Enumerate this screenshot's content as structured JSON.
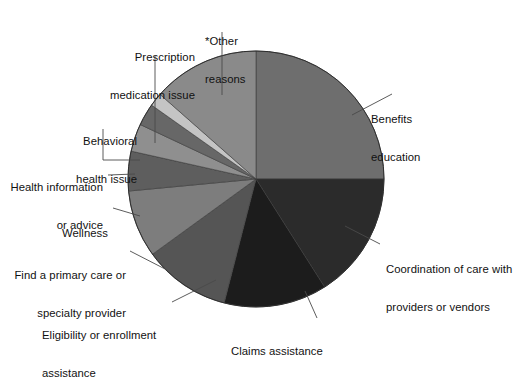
{
  "chart_data": {
    "type": "pie",
    "title": "",
    "subtitle": "",
    "xlabel": "",
    "ylabel": "",
    "legend_position": "none",
    "labels_position": "outside-with-leader-lines",
    "start_angle_deg": 0,
    "direction": "clockwise",
    "categories": [
      "Benefits education",
      "Coordination of care with providers or vendors",
      "Claims assistance",
      "Eligibility or enrollment assistance",
      "Find a primary care or specialty provider",
      "Wellness",
      "Health information or advice",
      "Behavioral health issue",
      "Prescription medication issue",
      "*Other reasons"
    ],
    "values": [
      25,
      16,
      13,
      11,
      8.5,
      5,
      3.5,
      2.8,
      1.7,
      13.5
    ],
    "slices": [
      {
        "label": "Benefits education",
        "value": 25,
        "angle_deg": 90,
        "color": "#6e6e6e",
        "label_side": "right",
        "label_lines": [
          "Benefits",
          "education"
        ]
      },
      {
        "label": "Coordination of care with providers or vendors",
        "value": 16,
        "angle_deg": 57.6,
        "color": "#2b2b2b",
        "label_side": "right",
        "label_lines": [
          "Coordination of care with",
          "providers or vendors"
        ]
      },
      {
        "label": "Claims assistance",
        "value": 13,
        "angle_deg": 46.8,
        "color": "#1c1c1c",
        "label_side": "bottom",
        "label_lines": [
          "Claims assistance"
        ]
      },
      {
        "label": "Eligibility or enrollment assistance",
        "value": 11,
        "angle_deg": 39.6,
        "color": "#555555",
        "label_side": "bottom-left",
        "label_lines": [
          "Eligibility or enrollment",
          "assistance"
        ]
      },
      {
        "label": "Find a primary care or specialty provider",
        "value": 8.5,
        "angle_deg": 30.6,
        "color": "#7d7d7d",
        "label_side": "left",
        "label_lines": [
          "Find a primary care or",
          "specialty provider"
        ]
      },
      {
        "label": "Wellness",
        "value": 5,
        "angle_deg": 18,
        "color": "#5e5e5e",
        "label_side": "left",
        "label_lines": [
          "Wellness"
        ]
      },
      {
        "label": "Health information or advice",
        "value": 3.5,
        "angle_deg": 12.6,
        "color": "#8f8f8f",
        "label_side": "left",
        "label_lines": [
          "Health information",
          "or advice"
        ]
      },
      {
        "label": "Behavioral health issue",
        "value": 2.8,
        "angle_deg": 10.1,
        "color": "#676767",
        "label_side": "left",
        "label_lines": [
          "Behavioral",
          "health issue"
        ]
      },
      {
        "label": "Prescription medication issue",
        "value": 1.7,
        "angle_deg": 6.1,
        "color": "#c4c4c4",
        "label_side": "top-left",
        "label_lines": [
          "Prescription",
          "medication issue"
        ]
      },
      {
        "label": "*Other reasons",
        "value": 13.5,
        "angle_deg": 48.6,
        "color": "#8a8a8a",
        "label_side": "top",
        "label_lines": [
          "*Other",
          "reasons"
        ]
      }
    ],
    "geometry": {
      "center_x": 256,
      "center_y": 179,
      "radius": 128
    }
  },
  "labels": {
    "benefits_education": {
      "line1": "Benefits",
      "line2": "education"
    },
    "coordination_of_care": {
      "line1": "Coordination of care with",
      "line2": "providers or vendors"
    },
    "claims_assistance": {
      "line1": "Claims assistance"
    },
    "eligibility_enrollment": {
      "line1": "Eligibility or enrollment",
      "line2": "assistance"
    },
    "find_provider": {
      "line1": "Find a primary care or",
      "line2": "specialty provider"
    },
    "wellness": {
      "line1": "Wellness"
    },
    "health_information": {
      "line1": "Health information",
      "line2": "or advice"
    },
    "behavioral_health": {
      "line1": "Behavioral",
      "line2": "health issue"
    },
    "prescription_medication": {
      "line1": "Prescription",
      "line2": "medication issue"
    },
    "other_reasons": {
      "line1": "*Other",
      "line2": "reasons"
    }
  },
  "colors": {
    "background": "#ffffff",
    "text": "#111111",
    "leader_line": "#4a4a4a",
    "slice_outline": "#3a3a3a"
  }
}
